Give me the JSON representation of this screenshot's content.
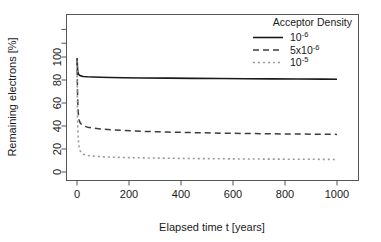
{
  "chart_data": {
    "type": "line",
    "title": "",
    "xlabel": "Elapsed time t [years]",
    "ylabel": "Remaining electrons [%]",
    "xlim": [
      0,
      1000
    ],
    "ylim": [
      0,
      110
    ],
    "xticks": [
      0,
      200,
      400,
      600,
      800,
      1000
    ],
    "xtick_labels": [
      "0",
      "200",
      "400",
      "600",
      "800",
      "1000"
    ],
    "yticks": [
      0,
      20,
      40,
      60,
      80,
      100
    ],
    "ytick_labels": [
      "0",
      "20",
      "40",
      "60",
      "80",
      "100"
    ],
    "grid": false,
    "legend_position": "top-right",
    "legend_title": "Acceptor Density",
    "series": [
      {
        "name": "10^-6",
        "label_base": "10",
        "label_exponent": "-6",
        "style": "solid",
        "color": "#1a1a1a",
        "x": [
          0,
          1,
          2,
          3,
          5,
          8,
          12,
          18,
          25,
          40,
          60,
          90,
          130,
          180,
          250,
          350,
          450,
          550,
          650,
          750,
          850,
          950,
          1000
        ],
        "y": [
          99,
          95.5,
          90,
          87.5,
          85.5,
          84.4,
          83.8,
          83.4,
          83.1,
          82.8,
          82.6,
          82.4,
          82.2,
          82.0,
          81.8,
          81.6,
          81.4,
          81.3,
          81.1,
          81.0,
          80.9,
          80.8,
          80.7
        ]
      },
      {
        "name": "5x10^-6",
        "label_base": "5x10",
        "label_exponent": "-6",
        "style": "dashed",
        "color": "#3c3c3c",
        "x": [
          0,
          1,
          2,
          3,
          5,
          8,
          12,
          18,
          25,
          40,
          60,
          90,
          130,
          180,
          250,
          350,
          450,
          550,
          650,
          750,
          850,
          950,
          1000
        ],
        "y": [
          98,
          85,
          70,
          60,
          51,
          45.5,
          42.8,
          41.2,
          40.2,
          39.0,
          38.2,
          37.4,
          36.7,
          36.1,
          35.4,
          34.7,
          34.2,
          33.8,
          33.5,
          33.2,
          33.0,
          32.8,
          32.7
        ]
      },
      {
        "name": "10^-5",
        "label_base": "10",
        "label_exponent": "-5",
        "style": "dotted",
        "color": "#9a9a9a",
        "x": [
          0,
          1,
          2,
          3,
          5,
          8,
          12,
          18,
          25,
          40,
          60,
          90,
          130,
          180,
          250,
          350,
          450,
          550,
          650,
          750,
          850,
          950,
          1000
        ],
        "y": [
          97,
          70,
          50,
          38,
          28,
          22,
          18.5,
          16.5,
          15.4,
          14.4,
          13.8,
          13.3,
          12.9,
          12.6,
          12.3,
          12.0,
          11.7,
          11.5,
          11.3,
          11.2,
          11.1,
          11.0,
          10.9
        ]
      }
    ]
  },
  "axes": {
    "y_title": "Remaining electrons [%]",
    "x_title": "Elapsed time t [years]"
  },
  "legend": {
    "title": "Acceptor Density",
    "entries": [
      {
        "base": "10",
        "exp": "-6",
        "style": "solid"
      },
      {
        "base": "5x10",
        "exp": "-6",
        "style": "dashed"
      },
      {
        "base": "10",
        "exp": "-5",
        "style": "dotted"
      }
    ]
  },
  "colors": {
    "series_1": "#1a1a1a",
    "series_2": "#3c3c3c",
    "series_3": "#9a9a9a",
    "frame": "#555555",
    "background": "#ffffff"
  }
}
